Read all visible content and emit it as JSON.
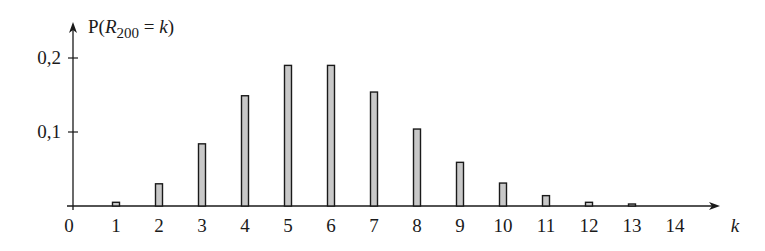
{
  "chart_data": {
    "type": "bar",
    "title": "",
    "ylabel": "P(R200 = k)",
    "ylabel_parts": {
      "prefix": "P(",
      "var": "R",
      "sub": "200",
      "eq": " = ",
      "k": "k",
      "suffix": ")"
    },
    "xlabel": "k",
    "categories": [
      "1",
      "2",
      "3",
      "4",
      "5",
      "6",
      "7",
      "8",
      "9",
      "10",
      "11",
      "12",
      "13",
      "14"
    ],
    "x": [
      1,
      2,
      3,
      4,
      5,
      6,
      7,
      8,
      9,
      10,
      11,
      12,
      13,
      14
    ],
    "values": [
      0.005,
      0.03,
      0.084,
      0.149,
      0.19,
      0.19,
      0.154,
      0.104,
      0.059,
      0.031,
      0.014,
      0.005,
      0.002,
      0.0
    ],
    "x_tick_labels": [
      "0",
      "1",
      "2",
      "3",
      "4",
      "5",
      "6",
      "7",
      "8",
      "9",
      "10",
      "11",
      "12",
      "13",
      "14"
    ],
    "y_ticks": [
      0.1,
      0.2
    ],
    "y_tick_labels": [
      "0,1",
      "0,2"
    ],
    "ylim": [
      0,
      0.25
    ],
    "xlim": [
      0,
      15.2
    ],
    "grid": false,
    "legend": null,
    "colors": {
      "bar_fill": "#c8c8c8",
      "bar_stroke": "#1a1a1a",
      "axis": "#1a1a1a"
    }
  }
}
